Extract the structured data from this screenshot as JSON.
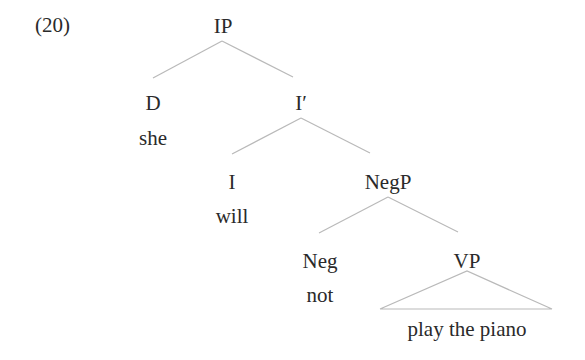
{
  "example_number": "(20)",
  "tree": {
    "root": {
      "label": "IP"
    },
    "specifier": {
      "category": "D",
      "word": "she"
    },
    "ibar": {
      "label": "I′"
    },
    "head_i": {
      "category": "I",
      "word": "will"
    },
    "negp": {
      "label": "NegP"
    },
    "neg": {
      "category": "Neg",
      "word": "not"
    },
    "vp": {
      "label": "VP",
      "yield": "play the piano"
    }
  },
  "style": {
    "line_color": "#b9b9b9",
    "text_color": "#2a2a2a"
  }
}
